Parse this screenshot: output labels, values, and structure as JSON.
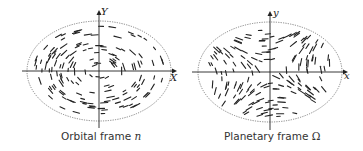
{
  "figure": {
    "panels": [
      {
        "id": "orbital",
        "caption_text": "Orbital frame",
        "caption_symbol": "n",
        "x_axis_label": "X",
        "y_axis_label": "Y",
        "description": "Ellipse with dashes arranged in concentric circular (tangential) pattern"
      },
      {
        "id": "planetary",
        "caption_text": "Planetary frame",
        "caption_symbol": "Ω",
        "x_axis_label": "x",
        "y_axis_label": "y",
        "description": "Ellipse with dashes arranged in hyperbolic / saddle flow pattern"
      }
    ],
    "colors": {
      "stroke": "#222222",
      "ellipse": "#555555",
      "background": "#ffffff"
    }
  }
}
